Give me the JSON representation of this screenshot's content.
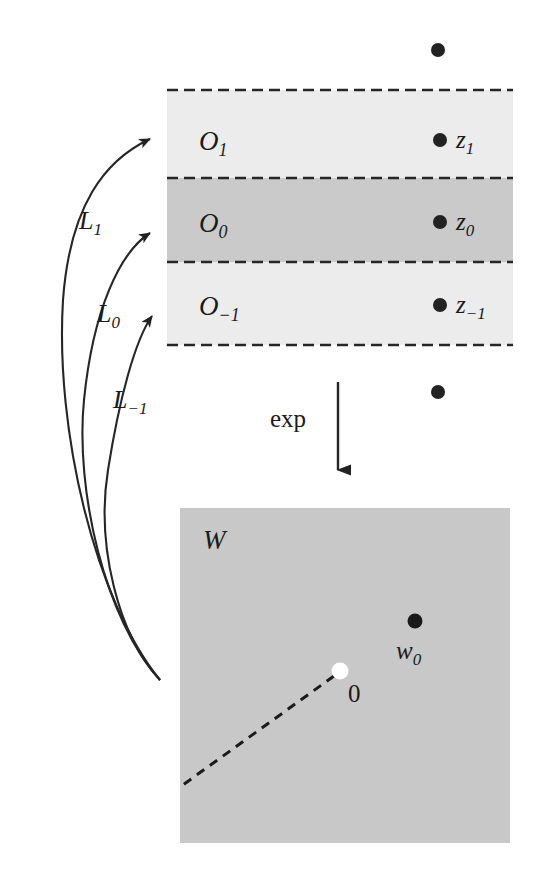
{
  "figure": {
    "colors": {
      "background": "#ffffff",
      "strip_light": "#ececec",
      "strip_dark": "#cacaca",
      "w_square": "#c8c8c8",
      "ink": "#1a1a1a",
      "origin_dot": "#ffffff"
    }
  },
  "strips": {
    "region": {
      "x": 167,
      "y": 90,
      "width": 346,
      "height": 255
    },
    "bands": [
      {
        "name": "O1",
        "label": "O",
        "subscript": "1",
        "fill": "#ececec",
        "y": 90,
        "height": 88
      },
      {
        "name": "O0",
        "label": "O",
        "subscript": "0",
        "fill": "#cacaca",
        "y": 178,
        "height": 84
      },
      {
        "name": "O-1",
        "label": "O",
        "subscript": "−1",
        "fill": "#ececec",
        "y": 262,
        "height": 83
      }
    ],
    "dashed_lines_y": [
      90,
      178,
      262,
      345
    ],
    "points": [
      {
        "name": "z1",
        "label": "z",
        "subscript": "1",
        "x": 440,
        "y": 140,
        "label_x": 456,
        "label_y": 147
      },
      {
        "name": "z0",
        "label": "z",
        "subscript": "0",
        "x": 440,
        "y": 222,
        "label_x": 456,
        "label_y": 229
      },
      {
        "name": "z-1",
        "label": "z",
        "subscript": "−1",
        "x": 440,
        "y": 305,
        "label_x": 456,
        "label_y": 312
      }
    ],
    "outside_points": [
      {
        "name": "dot-above-strip",
        "x": 438,
        "y": 50
      },
      {
        "name": "dot-below-strip",
        "x": 438,
        "y": 392
      }
    ]
  },
  "arrows": {
    "exp": {
      "label": "exp",
      "label_x": 306,
      "label_y": 427,
      "line_x": 338,
      "line_y_start": 382,
      "line_y_end": 478
    },
    "lifts": [
      {
        "name": "L1",
        "label": "L",
        "subscript": "1",
        "label_x": 79,
        "label_y": 229,
        "path": "M 160 680 C 95 600 55 430 63 300 C 70 205 105 160 155 138",
        "tip_x": 159,
        "tip_y": 136,
        "angle": -24
      },
      {
        "name": "L0",
        "label": "L",
        "subscript": "0",
        "label_x": 97,
        "label_y": 322,
        "path": "M 160 680 C 105 620 75 490 84 400 C 93 310 120 252 155 232",
        "tip_x": 159,
        "tip_y": 230,
        "angle": -30
      },
      {
        "name": "L-1",
        "label": "L",
        "subscript": "−1",
        "label_x": 113,
        "label_y": 408,
        "path": "M 160 680 C 118 635 96 545 108 470 C 119 400 135 340 157 315",
        "tip_x": 160,
        "tip_y": 312,
        "angle": -38
      }
    ]
  },
  "w_plane": {
    "name": "W",
    "label": "W",
    "label_x": 203,
    "label_y": 548,
    "square": {
      "x": 180,
      "y": 508,
      "width": 330,
      "height": 335
    },
    "fill": "#c8c8c8",
    "origin": {
      "name": "origin",
      "label": "0",
      "x": 340,
      "y": 671,
      "radius": 8,
      "label_x": 348,
      "label_y": 701
    },
    "point": {
      "name": "w0",
      "label": "w",
      "subscript": "0",
      "x": 415,
      "y": 621,
      "label_x": 398,
      "label_y": 657
    },
    "branch_cut": {
      "name": "branch-cut",
      "x1": 334,
      "y1": 676,
      "x2": 180,
      "y2": 787
    }
  }
}
